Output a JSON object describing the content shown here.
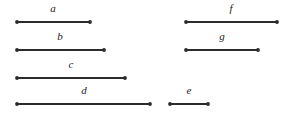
{
  "figure": {
    "background_color": "#ffffff",
    "stroke_color": "#2b2b2b",
    "label_color": "#1a1a1a",
    "canvas": {
      "width": 293,
      "height": 118
    }
  },
  "chart_data": {
    "type": "bar",
    "title": "",
    "subtitle": "",
    "xlabel": "",
    "ylabel": "",
    "orientation": "horizontal",
    "grid": false,
    "legend": null,
    "axis_visible": false,
    "units": "pixels",
    "note": "Seven horizontal line segments with dot endpoints, drawn in two columns; each segment is annotated with an italic letter centered above it.",
    "categories": [
      "a",
      "b",
      "c",
      "d",
      "e",
      "f",
      "g"
    ],
    "values": [
      73,
      87,
      108,
      133,
      38,
      91,
      72
    ],
    "xlim": [
      0,
      293
    ],
    "segments": [
      {
        "label": "a",
        "x1": 17,
        "x2": 90,
        "y": 22,
        "length": 73,
        "label_x": 53,
        "label_y": 14,
        "column": "left",
        "row": 1
      },
      {
        "label": "b",
        "x1": 17,
        "x2": 104,
        "y": 50,
        "length": 87,
        "label_x": 60,
        "label_y": 42,
        "column": "left",
        "row": 2
      },
      {
        "label": "c",
        "x1": 17,
        "x2": 125,
        "y": 78,
        "length": 108,
        "label_x": 71,
        "label_y": 70,
        "column": "left",
        "row": 3
      },
      {
        "label": "d",
        "x1": 17,
        "x2": 150,
        "y": 104,
        "length": 133,
        "label_x": 84,
        "label_y": 96,
        "column": "left",
        "row": 4
      },
      {
        "label": "e",
        "x1": 170,
        "x2": 208,
        "y": 104,
        "length": 38,
        "label_x": 189,
        "label_y": 96,
        "column": "right",
        "row": 4
      },
      {
        "label": "f",
        "x1": 186,
        "x2": 277,
        "y": 22,
        "length": 91,
        "label_x": 231,
        "label_y": 14,
        "column": "right",
        "row": 1
      },
      {
        "label": "g",
        "x1": 186,
        "x2": 258,
        "y": 50,
        "length": 72,
        "label_x": 222,
        "label_y": 42,
        "column": "right",
        "row": 2
      }
    ]
  }
}
